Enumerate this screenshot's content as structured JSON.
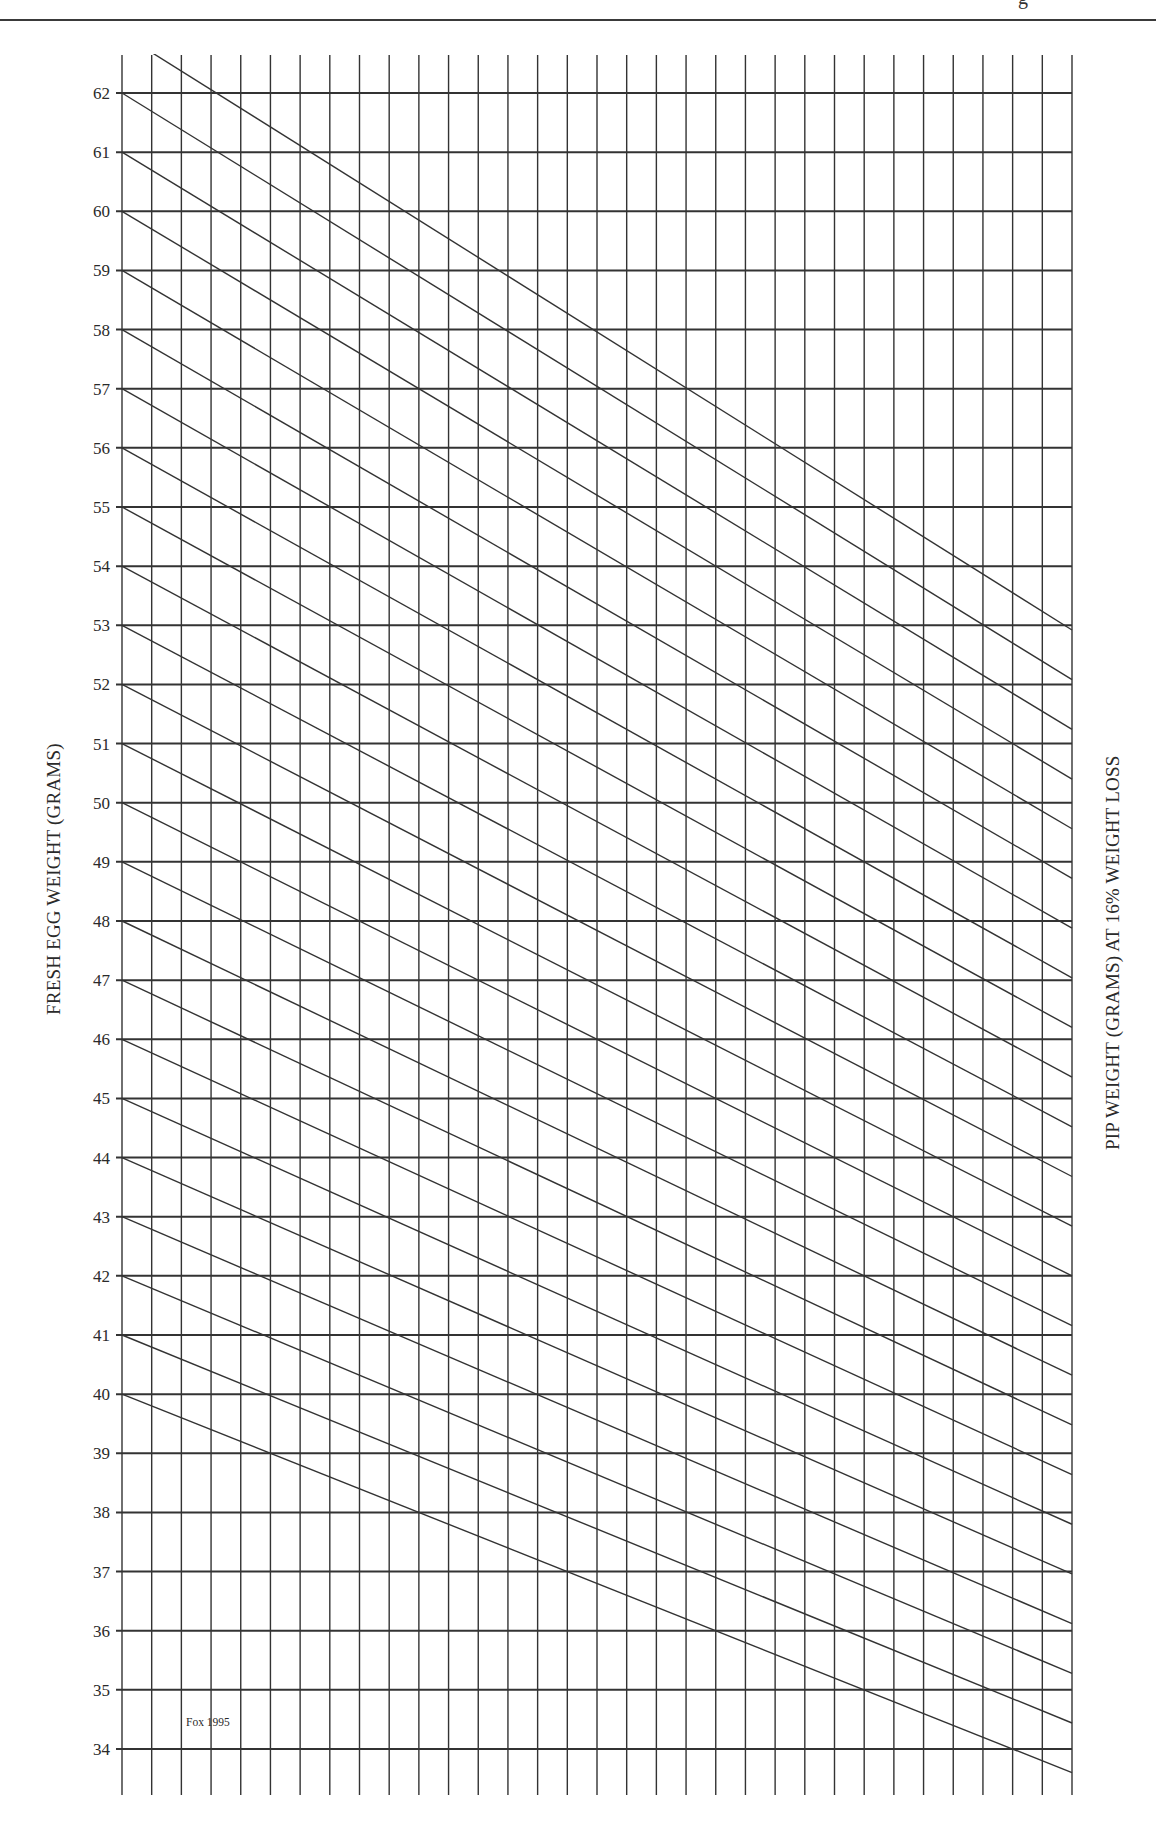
{
  "page": {
    "corner_text": "g",
    "credit": "Fox 1995"
  },
  "chart_data": {
    "type": "line",
    "title": "",
    "ylabel": "FRESH EGG WEIGHT (GRAMS)",
    "ylabel_right": "PIP WEIGHT (GRAMS) AT 16% WEIGHT LOSS",
    "xlabel": "",
    "ylim": [
      34,
      62
    ],
    "y_ticks": [
      62,
      61,
      60,
      59,
      58,
      57,
      56,
      55,
      54,
      53,
      52,
      51,
      50,
      49,
      48,
      47,
      46,
      45,
      44,
      43,
      42,
      41,
      40,
      39,
      38,
      37,
      36,
      35,
      34
    ],
    "vertical_gridlines": 33,
    "weight_loss_fraction": 0.16,
    "grid": true,
    "legend": "none",
    "annotation": "Fox 1995",
    "series": [
      {
        "name": "63 g",
        "start": 63,
        "end": 52.92
      },
      {
        "name": "62 g",
        "start": 62,
        "end": 52.08
      },
      {
        "name": "61 g",
        "start": 61,
        "end": 51.24
      },
      {
        "name": "60 g",
        "start": 60,
        "end": 50.4
      },
      {
        "name": "59 g",
        "start": 59,
        "end": 49.56
      },
      {
        "name": "58 g",
        "start": 58,
        "end": 48.72
      },
      {
        "name": "57 g",
        "start": 57,
        "end": 47.88
      },
      {
        "name": "56 g",
        "start": 56,
        "end": 47.04
      },
      {
        "name": "55 g",
        "start": 55,
        "end": 46.2
      },
      {
        "name": "54 g",
        "start": 54,
        "end": 45.36
      },
      {
        "name": "53 g",
        "start": 53,
        "end": 44.52
      },
      {
        "name": "52 g",
        "start": 52,
        "end": 43.68
      },
      {
        "name": "51 g",
        "start": 51,
        "end": 42.84
      },
      {
        "name": "50 g",
        "start": 50,
        "end": 42.0
      },
      {
        "name": "49 g",
        "start": 49,
        "end": 41.16
      },
      {
        "name": "48 g",
        "start": 48,
        "end": 40.32
      },
      {
        "name": "47 g",
        "start": 47,
        "end": 39.48
      },
      {
        "name": "46 g",
        "start": 46,
        "end": 38.64
      },
      {
        "name": "45 g",
        "start": 45,
        "end": 37.8
      },
      {
        "name": "44 g",
        "start": 44,
        "end": 36.96
      },
      {
        "name": "43 g",
        "start": 43,
        "end": 36.12
      },
      {
        "name": "42 g",
        "start": 42,
        "end": 35.28
      },
      {
        "name": "41 g",
        "start": 41,
        "end": 34.44
      },
      {
        "name": "40 g",
        "start": 40,
        "end": 33.6
      }
    ]
  }
}
